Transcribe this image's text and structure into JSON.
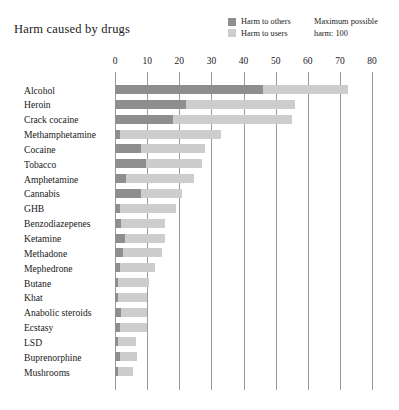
{
  "title": "Harm caused by drugs",
  "legend": {
    "items": [
      {
        "label": "Harm to others",
        "color": "#8e8e8e"
      },
      {
        "label": "Harm to users",
        "color": "#cdcdcd"
      }
    ]
  },
  "note": {
    "line1": "Maximum possible",
    "line2": "harm: 100"
  },
  "chart_data": {
    "type": "bar",
    "orientation": "horizontal",
    "stacked": true,
    "title": "Harm caused by drugs",
    "xlabel": "",
    "ylabel": "",
    "xlim": [
      0,
      80
    ],
    "xticks": [
      0,
      10,
      20,
      30,
      40,
      50,
      60,
      70,
      80
    ],
    "grid": true,
    "legend_position": "top-right",
    "annotation": "Maximum possible harm: 100",
    "categories": [
      "Alcohol",
      "Heroin",
      "Crack cocaine",
      "Methamphetamine",
      "Cocaine",
      "Tobacco",
      "Amphetamine",
      "Cannabis",
      "GHB",
      "Benzodiazepenes",
      "Ketamine",
      "Methadone",
      "Mephedrone",
      "Butane",
      "Khat",
      "Anabolic steroids",
      "Ecstasy",
      "LSD",
      "Buprenorphine",
      "Mushrooms"
    ],
    "series": [
      {
        "name": "Harm to others",
        "color": "#8e8e8e",
        "values": [
          46,
          22,
          18,
          1.5,
          8,
          9.5,
          3.5,
          8,
          1.5,
          2,
          3,
          2.5,
          1.5,
          1,
          1,
          2,
          1.5,
          1,
          1.5,
          1
        ]
      },
      {
        "name": "Harm to users",
        "color": "#cdcdcd",
        "values": [
          26.5,
          34,
          37,
          31.5,
          20,
          17.5,
          21,
          13,
          17.5,
          13.5,
          12.5,
          12,
          11,
          9.5,
          9,
          8,
          8.5,
          5.5,
          5.5,
          4.5
        ]
      }
    ],
    "totals": [
      72.5,
      56,
      55,
      33,
      28,
      27,
      24.5,
      21,
      19,
      15.5,
      15.5,
      14.5,
      12.5,
      10.5,
      10,
      10,
      10,
      6.5,
      7,
      5.5
    ]
  }
}
